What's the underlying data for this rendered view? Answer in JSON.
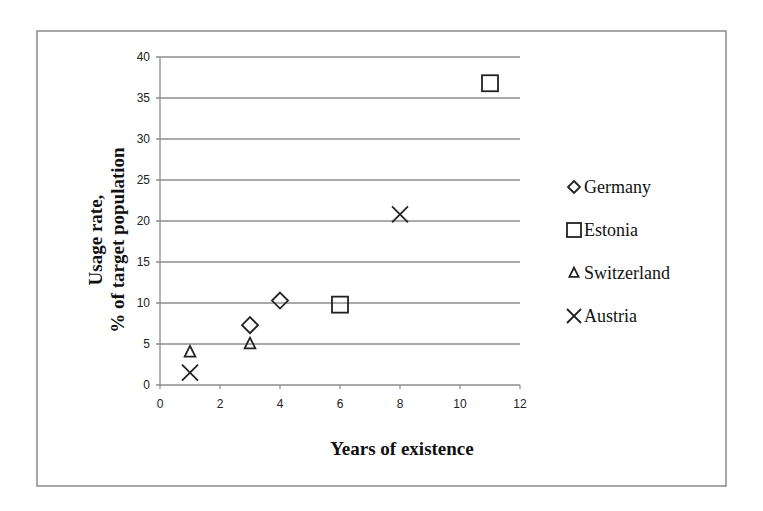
{
  "chart_data": {
    "type": "scatter",
    "title": "",
    "xlabel": "Years of existence",
    "ylabel": [
      "Usage rate,",
      "% of target population"
    ],
    "xlim": [
      0,
      12
    ],
    "ylim": [
      0,
      40
    ],
    "x_ticks": [
      0,
      2,
      4,
      6,
      8,
      10,
      12
    ],
    "y_ticks": [
      0,
      5,
      10,
      15,
      20,
      25,
      30,
      35,
      40
    ],
    "grid": {
      "horizontal": true,
      "vertical": false
    },
    "legend_position": "right",
    "series": [
      {
        "name": "Germany",
        "marker": "diamond",
        "points": [
          {
            "x": 3,
            "y": 7.3
          },
          {
            "x": 4,
            "y": 10.3
          }
        ]
      },
      {
        "name": "Estonia",
        "marker": "square",
        "points": [
          {
            "x": 6,
            "y": 9.8
          },
          {
            "x": 11,
            "y": 36.8
          }
        ]
      },
      {
        "name": "Switzerland",
        "marker": "triangle",
        "points": [
          {
            "x": 1,
            "y": 4.0
          },
          {
            "x": 3,
            "y": 5.0
          }
        ]
      },
      {
        "name": "Austria",
        "marker": "x",
        "points": [
          {
            "x": 1,
            "y": 1.5
          },
          {
            "x": 8,
            "y": 20.8
          }
        ]
      }
    ]
  },
  "colors": {
    "frame": "#8a8a8a",
    "grid": "#8c8c8c",
    "marker": "#222222"
  }
}
